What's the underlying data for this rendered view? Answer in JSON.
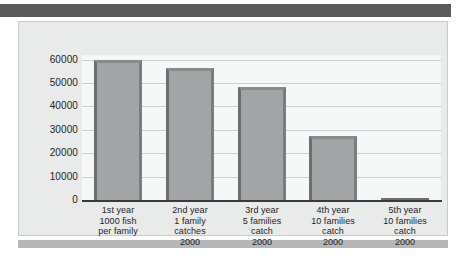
{
  "figure": {
    "top_band_color": "#5a5a5c",
    "bottom_band_color": "#b5b6b8",
    "frame_background": "#e9eaea",
    "plot_background": "#f6f7f7",
    "gridline_color": "#cdcecf",
    "axis_color": "#3a3a3c",
    "bar_fill_color": "#a3a4a6",
    "bar_edge_color": "#6e6f71"
  },
  "chart_data": {
    "type": "bar",
    "title": "",
    "subtitle": "",
    "xlabel": "",
    "ylabel": "",
    "ylim": [
      0,
      62000
    ],
    "yticks": [
      0,
      10000,
      20000,
      30000,
      40000,
      50000,
      60000
    ],
    "ytick_labels": [
      "0",
      "10000",
      "20000",
      "30000",
      "40000",
      "50000",
      "60000"
    ],
    "grid": true,
    "legend": null,
    "categories": [
      "1st year\n1000 fish\nper family",
      "2nd year\n1 family\ncatches\n2000",
      "3rd year\n5 families\ncatch\n2000",
      "4th year\n10 families\ncatch\n2000",
      "5th year\n10 families\ncatch\n2000"
    ],
    "category_lines": [
      [
        "1st year",
        "1000 fish",
        "per family"
      ],
      [
        "2nd year",
        "1 family",
        "catches",
        "2000"
      ],
      [
        "3rd year",
        "5 families",
        "catch",
        "2000"
      ],
      [
        "4th year",
        "10 families",
        "catch",
        "2000"
      ],
      [
        "5th year",
        "10 families",
        "catch",
        "2000"
      ]
    ],
    "values": [
      60000,
      56500,
      48500,
      27500,
      0
    ]
  }
}
